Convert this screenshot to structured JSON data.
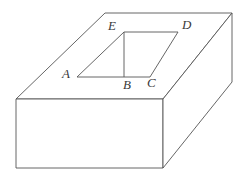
{
  "figure": {
    "background_color": "#ffffff",
    "line_color": "#555555",
    "label_color": "#3a3a3a",
    "stroke_width": 0.9,
    "labels": [
      {
        "text": "E",
        "x": 108,
        "y": 19
      },
      {
        "text": "D",
        "x": 182,
        "y": 18
      },
      {
        "text": "A",
        "x": 62,
        "y": 67
      },
      {
        "text": "B",
        "x": 123,
        "y": 78
      },
      {
        "text": "C",
        "x": 147,
        "y": 76
      }
    ],
    "outline": {
      "top_face": "105,13 232,13 163,99 16,99",
      "front_face": "16,99 163,99 163,168 16,168",
      "right_face": "163,99 232,13 232,82 163,168"
    },
    "opening": {
      "quad": "124,32 178,32 150,77 77,77",
      "segment_b": "124,32 124,77"
    }
  }
}
